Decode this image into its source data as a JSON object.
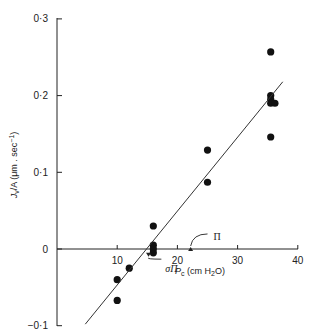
{
  "chart_data": {
    "type": "scatter",
    "title": "",
    "xlabel": "P_c (cm H2O)",
    "xlabel_parts": {
      "main": "P",
      "sub": "c",
      "unit_open": " (cm H",
      "unit_sub": "2",
      "unit_close": "O)"
    },
    "ylabel": "J_v/A (μm . sec⁻¹)",
    "ylabel_parts": {
      "main": "J",
      "sub": "v",
      "rest": "/A (μm . sec",
      "sup": "−1",
      "close": ")"
    },
    "xlim": [
      0,
      40
    ],
    "ylim": [
      -0.1,
      0.3
    ],
    "xticks": [
      10,
      20,
      30,
      40
    ],
    "xtick_labels": [
      "10",
      "20",
      "30",
      "40"
    ],
    "yticks": [
      -0.1,
      0,
      0.1,
      0.2,
      0.3
    ],
    "ytick_labels": [
      "−0·1",
      "0",
      "0·1",
      "0·2",
      "0·3"
    ],
    "grid": false,
    "series": [
      {
        "name": "observations",
        "marker": "filled-circle",
        "points": [
          [
            10,
            -0.04
          ],
          [
            10,
            -0.067
          ],
          [
            12,
            -0.025
          ],
          [
            16,
            0.03
          ],
          [
            16,
            0.005
          ],
          [
            16,
            0.0
          ],
          [
            16,
            -0.005
          ],
          [
            25,
            0.129
          ],
          [
            25,
            0.087
          ],
          [
            35.5,
            0.257
          ],
          [
            35.5,
            0.2
          ],
          [
            35.5,
            0.195
          ],
          [
            35.5,
            0.19
          ],
          [
            36.2,
            0.19
          ],
          [
            35.5,
            0.146
          ]
        ]
      },
      {
        "name": "regression line",
        "type": "line",
        "points": [
          [
            4.7,
            -0.098
          ],
          [
            37.5,
            0.218
          ]
        ]
      }
    ],
    "annotations": [
      {
        "text": "Π",
        "target": [
          22.2,
          0
        ],
        "label_pos": [
          26,
          0.017
        ]
      },
      {
        "text": "σΠ",
        "target": [
          15.2,
          -0.005
        ],
        "label_pos": [
          18,
          -0.025
        ]
      }
    ]
  }
}
